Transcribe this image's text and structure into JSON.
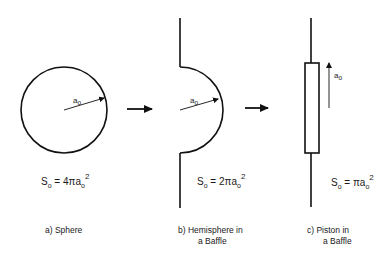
{
  "panels": [
    {
      "id": "a",
      "shape": "sphere",
      "radius_label": {
        "base": "a",
        "sub": "o"
      },
      "equation": {
        "lhs_base": "S",
        "lhs_sub": "o",
        "rhs_prefix": " = 4πa",
        "rhs_sub": "o",
        "rhs_sup": "2"
      },
      "caption_line1": "a)  Sphere",
      "caption_line2": ""
    },
    {
      "id": "b",
      "shape": "hemisphere-in-baffle",
      "radius_label": {
        "base": "a",
        "sub": "o"
      },
      "equation": {
        "lhs_base": "S",
        "lhs_sub": "o",
        "rhs_prefix": " = 2πa",
        "rhs_sub": "o",
        "rhs_sup": "2"
      },
      "caption_line1": "b)  Hemisphere in",
      "caption_line2": "a Baffle"
    },
    {
      "id": "c",
      "shape": "piston-in-baffle",
      "radius_label": {
        "base": "a",
        "sub": "o"
      },
      "equation": {
        "lhs_base": "S",
        "lhs_sub": "o",
        "rhs_prefix": " = πa",
        "rhs_sub": "o",
        "rhs_sup": "2"
      },
      "caption_line1": "c)  Piston in",
      "caption_line2": "a Baffle"
    }
  ],
  "transitions": [
    {
      "from": "a",
      "to": "b",
      "icon": "right-arrow-icon"
    },
    {
      "from": "b",
      "to": "c",
      "icon": "right-arrow-icon"
    }
  ],
  "colors": {
    "stroke": "#111111",
    "background": "#ffffff"
  }
}
